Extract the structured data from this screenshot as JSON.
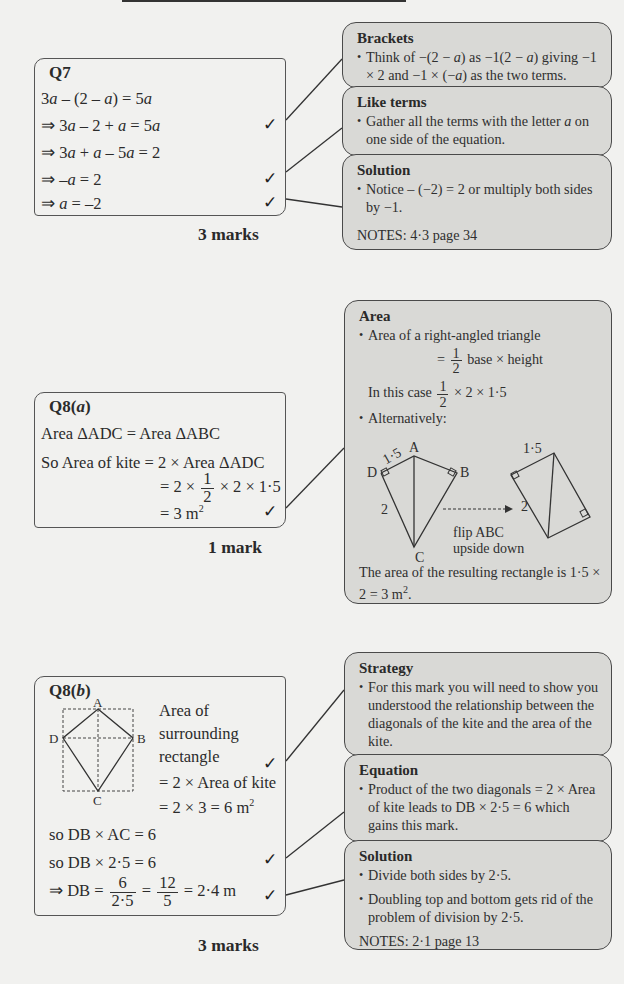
{
  "q7": {
    "title": "Q7",
    "lines": [
      "3a – (2 – a) = 5a",
      "⇒ 3a – 2 + a = 5a",
      "⇒ 3a + a – 5a = 2",
      "⇒ –a = 2",
      "⇒ a = –2"
    ],
    "ticks": [
      "✓",
      "✓",
      "✓"
    ],
    "marks": "3 marks",
    "hints": [
      {
        "title": "Brackets",
        "bullets": [
          "Think of −(2 − a) as −1(2 − a) giving −1 × 2 and −1 × (−a) as the two terms."
        ]
      },
      {
        "title": "Like terms",
        "bullets": [
          "Gather all the terms with the letter a on one side of the equation."
        ]
      },
      {
        "title": "Solution",
        "bullets": [
          "Notice – (−2) = 2 or multiply both sides by −1."
        ],
        "notes": "NOTES: 4·3 page 34"
      }
    ]
  },
  "q8a": {
    "title": "Q8(a)",
    "lines": [
      "Area ΔADC = Area ΔABC",
      "So Area of kite = 2 × Area ΔADC",
      "= 2 ×",
      "× 2 × 1·5",
      "= 3 m²"
    ],
    "frac_num": "1",
    "frac_den": "2",
    "tick": "✓",
    "marks": "1 mark",
    "hint": {
      "title": "Area",
      "bullet1": "Area of a right-angled triangle",
      "formula_eq": "=",
      "formula_rest": "base × height",
      "in_this_case": "In this case",
      "in_this_case_rest": "× 2 × 1·5",
      "bullet2": "Alternatively:",
      "diagram": {
        "labels": {
          "A": "A",
          "B": "B",
          "C": "C",
          "D": "D",
          "ad": "1·5",
          "dc": "2",
          "rect_top": "1·5",
          "rect_side": "2"
        },
        "arrow_caption_1": "flip ABC",
        "arrow_caption_2": "upside down"
      },
      "conclusion": "The area of the resulting rectangle is 1·5 × 2 = 3 m²."
    }
  },
  "q8b": {
    "title": "Q8(b)",
    "diagram_labels": {
      "A": "A",
      "B": "B",
      "C": "C",
      "D": "D"
    },
    "side_text": [
      "Area of",
      "surrounding",
      "rectangle",
      "= 2 × Area of kite",
      "= 2 × 3 = 6 m²"
    ],
    "lines": [
      "so DB × AC = 6",
      "so DB × 2·5 = 6"
    ],
    "final": {
      "lhs": "⇒ DB =",
      "f1_num": "6",
      "f1_den": "2·5",
      "eq": "=",
      "f2_num": "12",
      "f2_den": "5",
      "rhs": "= 2·4 m"
    },
    "ticks": [
      "✓",
      "✓",
      "✓"
    ],
    "marks": "3 marks",
    "hints": [
      {
        "title": "Strategy",
        "bullets": [
          "For this mark you will need to show you understood the relationship between the diagonals of the kite and the area of the kite."
        ]
      },
      {
        "title": "Equation",
        "bullets": [
          "Product of the two diagonals = 2 × Area of kite leads to DB × 2·5 = 6 which gains this mark."
        ]
      },
      {
        "title": "Solution",
        "bullets": [
          "Divide both sides by 2·5.",
          "Doubling top and bottom gets rid of the problem of division by 2·5."
        ],
        "notes": "NOTES: 2·1 page 13"
      }
    ]
  },
  "colors": {
    "page_bg": "#f1f1ef",
    "hint_bg": "#d9d9d6",
    "border": "#4a4a4a"
  }
}
